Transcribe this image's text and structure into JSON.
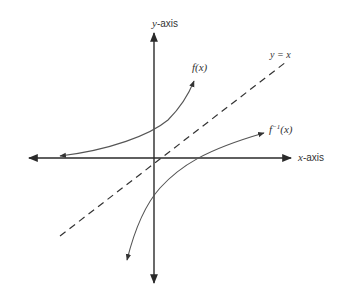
{
  "diagram": {
    "type": "function-and-inverse-graph",
    "axes": {
      "y_label_var": "y",
      "y_label_suffix": "-axis",
      "x_label_var": "x",
      "x_label_suffix": "-axis"
    },
    "lines": {
      "identity_label": "y = x",
      "identity_style": "dashed"
    },
    "curves": {
      "f_label": "f(x)",
      "f_inverse_base": "f",
      "f_inverse_sup": "−1",
      "f_inverse_arg": "(x)"
    },
    "colors": {
      "axis": "#2a2a2a",
      "curve": "#555555",
      "dashed": "#333333",
      "background": "#ffffff"
    }
  }
}
